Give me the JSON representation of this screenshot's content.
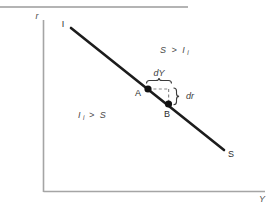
{
  "figure": {
    "title_rule": "top-horizontal-rule",
    "axes": {
      "y_axis_label": "r",
      "x_axis_label": "Y"
    },
    "curve": {
      "start_label": "I",
      "end_label": "S",
      "description": "downward-sloping IS curve"
    },
    "points": [
      {
        "id": "A",
        "label": "A"
      },
      {
        "id": "B",
        "label": "B"
      }
    ],
    "differentials": {
      "horizontal": "dY",
      "vertical": "dr"
    },
    "regions": [
      {
        "id": "upper-right",
        "main": "S",
        "operator": ">",
        "second": "I",
        "second_sub": "i"
      },
      {
        "id": "lower-left",
        "main": "I",
        "main_sub": "i",
        "operator": ">",
        "second": "S"
      }
    ],
    "colors": {
      "axis": "#9a9a9a",
      "curve": "#1c1c1c",
      "dashed": "#8a8a8a",
      "text": "#2b2b2b",
      "rule": "#6b6b6b",
      "background": "#ffffff"
    }
  }
}
